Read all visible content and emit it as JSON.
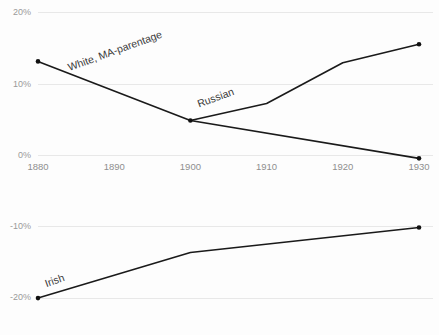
{
  "chart_data": {
    "type": "line",
    "title": "",
    "subtitle": "",
    "xlabel": "",
    "ylabel": "",
    "grid": true,
    "legend_position": "inline-labels",
    "x": [
      1880,
      1890,
      1900,
      1910,
      1920,
      1930
    ],
    "xlim": [
      1880,
      1930
    ],
    "panels": [
      {
        "name": "upper-panel",
        "ylim": [
          0,
          20
        ],
        "yticks": [
          0,
          10,
          20
        ],
        "ytick_labels": [
          "0%",
          "10%",
          "20%"
        ]
      },
      {
        "name": "lower-panel",
        "ylim": [
          -20,
          -10
        ],
        "yticks": [
          -20,
          -10
        ],
        "ytick_labels": [
          "-20%",
          "-10%"
        ]
      }
    ],
    "series": [
      {
        "name": "White, MA-parentage",
        "label": "White, MA-parentage",
        "panel": "upper-panel",
        "x": [
          1880,
          1900,
          1930
        ],
        "values": [
          13.2,
          4.9,
          -0.4
        ],
        "label_x": 1884,
        "label_y": 12.2,
        "label_rotation": -20
      },
      {
        "name": "Russian",
        "label": "Russian",
        "panel": "upper-panel",
        "x": [
          1900,
          1910,
          1920,
          1930
        ],
        "values": [
          4.9,
          7.3,
          13.0,
          15.6
        ],
        "label_x": 1901,
        "label_y": 7.1,
        "label_rotation": -20
      },
      {
        "name": "Irish",
        "label": "Irish",
        "panel": "lower-panel",
        "x": [
          1880,
          1900,
          1930
        ],
        "values": [
          -20.0,
          -13.6,
          -10.1
        ],
        "label_x": 1881,
        "label_y": -18.1,
        "label_rotation": -20
      }
    ],
    "xtick_labels": [
      "1880",
      "1890",
      "1900",
      "1910",
      "1920",
      "1930"
    ],
    "colors": {
      "line": "#1a1a1a",
      "grid": "#e8e8e8",
      "tick_text": "#9a9a9a",
      "label_text": "#3a3a3a",
      "background": "#fdfdfd"
    }
  }
}
